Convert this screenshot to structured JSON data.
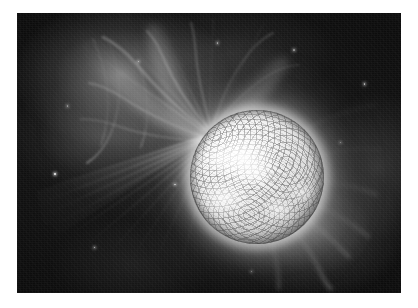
{
  "page": {
    "background_color": "#ffffff",
    "width": 418,
    "height": 308
  },
  "photograph": {
    "title": "",
    "caption": "",
    "alt_description": "Black and white astronomical photograph of a star with a large flare erupting from its upper-left limb",
    "frame": {
      "x": 17,
      "y": 13,
      "width": 384,
      "height": 280
    },
    "palette": {
      "space_black": "#0a0a0a",
      "deep_shadow": "#060606",
      "mid_gray": "#6e6e6e",
      "haze_gray": "#b4b4b4",
      "flare_white": "#ffffff",
      "disc_gray": "#dcdcdc",
      "sunspot_dark": "#282828",
      "page_white": "#ffffff"
    },
    "subject": {
      "name": "stellar-disc",
      "label": "Star disc",
      "center_x_pct": 62.5,
      "center_y_pct": 58.5,
      "radius_pct": 17.5,
      "surface": "mottled granulation with dark sunspot patches"
    },
    "flare": {
      "name": "solar-flare-burst",
      "label": "Flare core",
      "center_x_pct": 48,
      "center_y_pct": 41,
      "direction": "upper-left"
    },
    "features": [
      {
        "id": "upper-left-streamers",
        "label": "Filamentary coronal streamers, upper left"
      },
      {
        "id": "lower-left-rays",
        "label": "Straight radial flare rays, lower left"
      },
      {
        "id": "lower-right-plume",
        "label": "Diffuse coronal plume, lower right"
      },
      {
        "id": "right-edge-glow",
        "label": "Faint coronal glow along right edge"
      }
    ],
    "stars": [
      {
        "x_pct": 9.6,
        "y_pct": 57.0,
        "size": 2.4,
        "brightness": 0.95
      },
      {
        "x_pct": 20.0,
        "y_pct": 83.5,
        "size": 1.6,
        "brightness": 0.72
      },
      {
        "x_pct": 90.3,
        "y_pct": 25.0,
        "size": 1.6,
        "brightness": 0.7
      },
      {
        "x_pct": 52.0,
        "y_pct": 10.5,
        "size": 1.3,
        "brightness": 0.58
      },
      {
        "x_pct": 31.5,
        "y_pct": 17.0,
        "size": 1.5,
        "brightness": 0.62
      },
      {
        "x_pct": 72.0,
        "y_pct": 13.0,
        "size": 1.2,
        "brightness": 0.5
      },
      {
        "x_pct": 41.0,
        "y_pct": 61.0,
        "size": 1.4,
        "brightness": 0.66
      },
      {
        "x_pct": 13.0,
        "y_pct": 33.0,
        "size": 1.2,
        "brightness": 0.48
      },
      {
        "x_pct": 84.0,
        "y_pct": 46.0,
        "size": 1.2,
        "brightness": 0.46
      },
      {
        "x_pct": 61.0,
        "y_pct": 92.0,
        "size": 1.2,
        "brightness": 0.44
      }
    ]
  }
}
